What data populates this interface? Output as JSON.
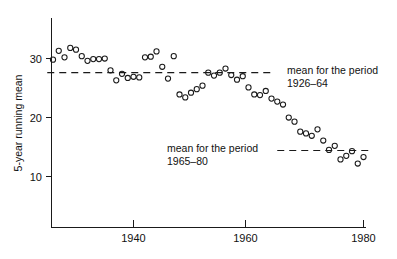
{
  "chart_data": {
    "type": "scatter",
    "title": "",
    "xlabel": "",
    "ylabel": "5-year running mean",
    "xlim": [
      1925,
      1980
    ],
    "ylim": [
      5,
      34
    ],
    "grid": false,
    "legend_position": "none",
    "xticks": [
      1940,
      1960,
      1980
    ],
    "xticklabels": [
      "1940",
      "1960",
      "1980"
    ],
    "yticks": [
      10,
      20,
      30
    ],
    "yticklabels": [
      "10",
      "20",
      "30"
    ],
    "marker": "open-circle",
    "series": [
      {
        "name": "5-year running mean",
        "x": [
          1926,
          1927,
          1928,
          1929,
          1930,
          1931,
          1932,
          1933,
          1934,
          1935,
          1936,
          1937,
          1938,
          1939,
          1940,
          1941,
          1942,
          1943,
          1944,
          1945,
          1946,
          1947,
          1948,
          1949,
          1950,
          1951,
          1952,
          1953,
          1954,
          1955,
          1956,
          1957,
          1958,
          1959,
          1960,
          1961,
          1962,
          1963,
          1964,
          1965,
          1966,
          1967,
          1968,
          1969,
          1970,
          1971,
          1972,
          1973,
          1974,
          1975,
          1976,
          1977,
          1978,
          1979,
          1980
        ],
        "y": [
          29.8,
          31.3,
          30.2,
          31.8,
          31.5,
          30.4,
          29.6,
          29.9,
          29.9,
          30.0,
          28.0,
          26.3,
          27.4,
          26.7,
          26.9,
          26.8,
          30.2,
          30.3,
          31.2,
          28.6,
          26.6,
          30.4,
          23.9,
          23.4,
          24.2,
          24.8,
          25.4,
          27.6,
          27.1,
          27.6,
          28.3,
          27.2,
          26.4,
          27.0,
          25.1,
          23.9,
          23.8,
          24.5,
          23.2,
          22.7,
          22.2,
          20.0,
          19.3,
          17.6,
          17.3,
          16.9,
          18.0,
          16.1,
          14.5,
          15.2,
          12.9,
          13.5,
          14.3,
          12.2,
          13.3
        ]
      }
    ],
    "annotations": [
      {
        "name": "mean-1926-64",
        "label_line1": "mean for the period",
        "label_line2": "1926–64",
        "value": 27.6,
        "x_start": 1925.0,
        "x_end": 1964.5,
        "label_x": 1965.5,
        "style": "dashed"
      },
      {
        "name": "mean-1965-80",
        "label_line1": "mean for the period",
        "label_line2": "1965–80",
        "value": 14.4,
        "x_start": 1965.0,
        "x_end": 1981.0,
        "label_x": 1943.0,
        "style": "dashed"
      }
    ]
  }
}
